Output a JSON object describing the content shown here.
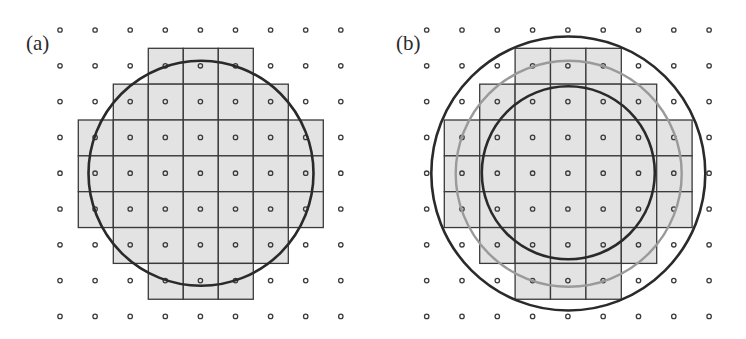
{
  "figure": {
    "width": 746,
    "height": 339,
    "colors": {
      "background": "#ffffff",
      "cell_fill": "#e3e3e3",
      "cell_stroke": "#3a3a3a",
      "dot_stroke": "#3c3c3c",
      "dark_circle": "#2a2a2a",
      "gray_circle": "#9a9a9a"
    }
  },
  "panels": [
    {
      "id": "a",
      "label": "(a)",
      "label_pos": [
        26,
        33
      ],
      "dot_grid": {
        "x0": 60,
        "y0": 30,
        "dx": 35.1,
        "dy": 35.8,
        "cols": 9,
        "rows": 9
      },
      "cell_grid": {
        "x0": 78.3,
        "y0": 48.3,
        "size_x": 35.0,
        "size_y": 35.85
      },
      "cell_rows": [
        {
          "row": 0,
          "col_start": 2,
          "col_end": 4
        },
        {
          "row": 1,
          "col_start": 1,
          "col_end": 5
        },
        {
          "row": 2,
          "col_start": 0,
          "col_end": 6
        },
        {
          "row": 3,
          "col_start": 0,
          "col_end": 6
        },
        {
          "row": 4,
          "col_start": 0,
          "col_end": 6
        },
        {
          "row": 5,
          "col_start": 1,
          "col_end": 5
        },
        {
          "row": 6,
          "col_start": 2,
          "col_end": 4
        }
      ],
      "circles": [
        {
          "name": "circle",
          "cx": 201,
          "cy": 173.3,
          "r": 112.5,
          "color": "dark",
          "width": 2.6
        }
      ]
    },
    {
      "id": "b",
      "label": "(b)",
      "label_pos": [
        396,
        33
      ],
      "dot_grid": {
        "x0": 426.7,
        "y0": 30,
        "dx": 35.3,
        "dy": 35.8,
        "cols": 9,
        "rows": 9
      },
      "cell_grid": {
        "x0": 444.3,
        "y0": 48.3,
        "size_x": 35.4,
        "size_y": 35.85
      },
      "cell_rows": [
        {
          "row": 0,
          "col_start": 2,
          "col_end": 4
        },
        {
          "row": 1,
          "col_start": 1,
          "col_end": 5
        },
        {
          "row": 2,
          "col_start": 0,
          "col_end": 6
        },
        {
          "row": 3,
          "col_start": 0,
          "col_end": 6
        },
        {
          "row": 4,
          "col_start": 0,
          "col_end": 6
        },
        {
          "row": 5,
          "col_start": 1,
          "col_end": 5
        },
        {
          "row": 6,
          "col_start": 2,
          "col_end": 4
        }
      ],
      "circles": [
        {
          "name": "outer-circle",
          "cx": 568.3,
          "cy": 173.5,
          "r": 137,
          "color": "dark",
          "width": 2.6
        },
        {
          "name": "middle-gray-circle",
          "cx": 568.7,
          "cy": 173.8,
          "r": 113,
          "color": "gray",
          "width": 2.4
        },
        {
          "name": "inner-circle",
          "cx": 568.3,
          "cy": 172.8,
          "r": 86.5,
          "color": "dark",
          "width": 2.6
        }
      ]
    }
  ]
}
